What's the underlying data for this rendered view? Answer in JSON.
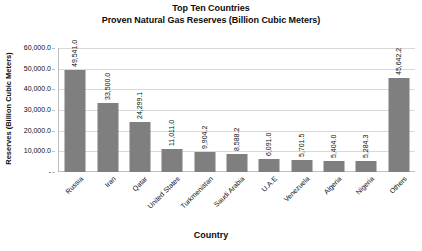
{
  "chart_data": {
    "type": "bar",
    "title": "Top Ten Countries Proven Natural Gas Reserves (Billion Cubic Meters)",
    "title_line1": "Top Ten Countries",
    "title_line2": "Proven Natural Gas Reserves (Billion Cubic Meters)",
    "xlabel": "Country",
    "ylabel": "Reserves (Billion Cubic Meters)",
    "categories": [
      "Russia",
      "Iran",
      "Qatar",
      "United States",
      "Turkmenistan",
      "Saudi Arabia",
      "U.A.E",
      "Venezuela",
      "Algeria",
      "Nigeria",
      "Others"
    ],
    "values": [
      49541.0,
      33500.0,
      24299.1,
      11011.0,
      9904.2,
      8588.2,
      6091.0,
      5701.5,
      5404.0,
      5284.3,
      45642.2
    ],
    "data_labels": [
      "49,541.0",
      "33,500.0",
      "24,299.1",
      "11,011.0",
      "9,904.2",
      "8,588.2",
      "6,091.0",
      "5,701.5",
      "5,404.0",
      "5,284.3",
      "45,642.2"
    ],
    "ylim": [
      0,
      60000
    ],
    "ytick_values": [
      0,
      10000,
      20000,
      30000,
      40000,
      50000,
      60000
    ],
    "ytick_labels": [
      "-",
      "10,000.0",
      "20,000.0",
      "30,000.0",
      "40,000.0",
      "50,000.0",
      "60,000.0"
    ],
    "grid": true,
    "legend": "none",
    "bar_color": "#7f7f7f",
    "gridline_color": "#d9d9d9",
    "background_color": "#ffffff"
  }
}
